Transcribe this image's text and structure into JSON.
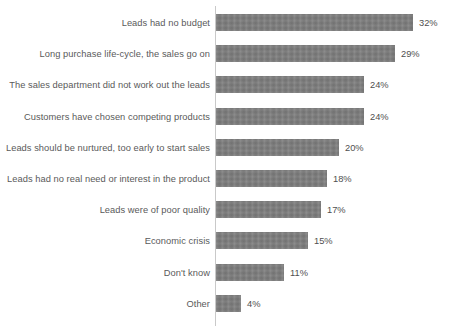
{
  "chart_data": {
    "type": "bar",
    "orientation": "horizontal",
    "title": "",
    "subtitle": "",
    "xlabel": "",
    "ylabel": "",
    "xlim": [
      0,
      32
    ],
    "grid": false,
    "legend": null,
    "value_suffix": "%",
    "categories": [
      "Leads had no budget",
      "Long purchase life-cycle, the sales go on",
      "The sales department did not work out the leads",
      "Customers have chosen competing products",
      "Leads should be nurtured, too early to start sales",
      "Leads had no real need or interest in the product",
      "Leads were of poor quality",
      "Economic crisis",
      "Don't know",
      "Other"
    ],
    "values": [
      32,
      29,
      24,
      24,
      20,
      18,
      17,
      15,
      11,
      4
    ],
    "value_labels": [
      "32%",
      "29%",
      "24%",
      "24%",
      "20%",
      "18%",
      "17%",
      "15%",
      "11%",
      "4%"
    ],
    "series": [
      {
        "name": "Share of respondents",
        "values": [
          32,
          29,
          24,
          24,
          20,
          18,
          17,
          15,
          11,
          4
        ]
      }
    ],
    "colors": {
      "bar": "#7b7b7b",
      "axis": "#c9c9c9",
      "category_label": "#5a5a5a",
      "value_label": "#4f4f4f",
      "background": "#ffffff"
    }
  },
  "footnote": {
    "text": ""
  }
}
